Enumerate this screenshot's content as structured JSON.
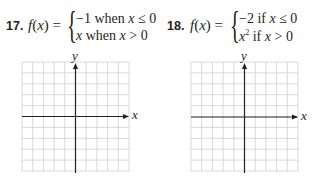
{
  "problems": [
    {
      "number": "17.",
      "lhs_fn": "f",
      "lhs_arg": "(x)",
      "lhs_eq": "=",
      "cases": [
        {
          "value": "−1",
          "cond_word": "when",
          "var": "x",
          "rel": "≤ 0"
        },
        {
          "value": "x",
          "value_italic": true,
          "cond_word": "when",
          "var": "x",
          "rel": "> 0"
        }
      ],
      "graph": {
        "x_label": "x",
        "y_label": "y",
        "grid_cols": 10,
        "grid_rows": 10
      }
    },
    {
      "number": "18.",
      "lhs_fn": "f",
      "lhs_arg": "(x)",
      "lhs_eq": "=",
      "cases": [
        {
          "value": "−2",
          "cond_word": "if",
          "var": "x",
          "rel": "≤ 0"
        },
        {
          "value": "x",
          "value_exp": "2",
          "value_italic": true,
          "cond_word": "if",
          "var": "x",
          "rel": "> 0"
        }
      ],
      "graph": {
        "x_label": "x",
        "y_label": "y",
        "grid_cols": 10,
        "grid_rows": 10
      }
    }
  ],
  "colors": {
    "grid": "#cfcfcf",
    "axis": "#231f20",
    "text": "#231f20"
  }
}
